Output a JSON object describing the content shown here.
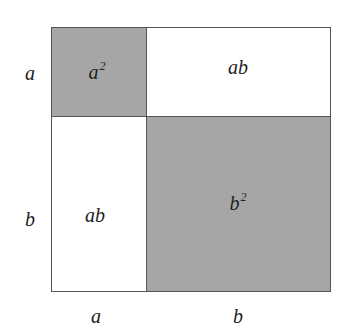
{
  "diagram": {
    "title": "",
    "colors": {
      "shaded": "#a6a6a6",
      "unshaded": "#ffffff",
      "stroke": "#555555"
    },
    "regions": [
      {
        "id": "a2",
        "label_base": "a",
        "label_exp": "2",
        "shaded": true
      },
      {
        "id": "ab_top",
        "label": "ab",
        "shaded": false
      },
      {
        "id": "ab_left",
        "label": "ab",
        "shaded": false
      },
      {
        "id": "b2",
        "label_base": "b",
        "label_exp": "2",
        "shaded": true
      }
    ],
    "side_labels": {
      "left_top": "a",
      "left_bottom": "b",
      "bottom_left": "a",
      "bottom_right": "b"
    }
  }
}
